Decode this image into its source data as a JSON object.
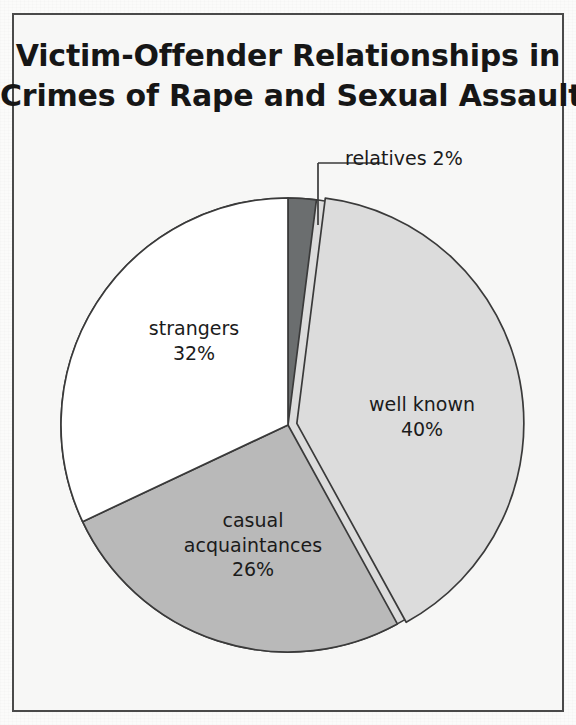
{
  "figure": {
    "title_line_1": "Victim-Offender Relationships in",
    "title_line_2": "Crimes of Rape and Sexual Assault",
    "frame_color": "#4a4a4a",
    "paper_color": "#f7f7f6"
  },
  "labels": {
    "relatives": {
      "name": "relatives 2%",
      "text": "relatives 2%"
    },
    "strangers": {
      "name": "strangers",
      "value": "32%"
    },
    "well_known": {
      "name": "well known",
      "value": "40%"
    },
    "casual": {
      "name_line_1": "casual",
      "name_line_2": "acquaintances",
      "value": "26%"
    }
  },
  "chart_data": {
    "type": "pie",
    "title": "Victim-Offender Relationships in Crimes of Rape and Sexual Assault",
    "xlabel": "",
    "ylabel": "",
    "units": "percent",
    "total": 100,
    "start_angle_deg": 0,
    "direction": "clockwise",
    "legend": "none",
    "grid": false,
    "labels_inside_slices": true,
    "categories": [
      "relatives",
      "well known",
      "casual acquaintances",
      "strangers"
    ],
    "values": [
      2,
      40,
      26,
      32
    ],
    "slices": [
      {
        "label": "relatives",
        "value": 2,
        "display": "relatives 2%",
        "color": "#6b6e6f",
        "exploded": false,
        "label_placement": "outside-leader"
      },
      {
        "label": "well known",
        "value": 40,
        "display": "well known 40%",
        "color": "#dcdcdc",
        "exploded": true,
        "label_placement": "inside"
      },
      {
        "label": "casual acquaintances",
        "value": 26,
        "display": "casual acquaintances 26%",
        "color": "#b9b9b9",
        "exploded": false,
        "label_placement": "inside"
      },
      {
        "label": "strangers",
        "value": 32,
        "display": "strangers 32%",
        "color": "#ffffff",
        "exploded": false,
        "label_placement": "inside"
      }
    ],
    "colors": [
      "#6b6e6f",
      "#dcdcdc",
      "#b9b9b9",
      "#ffffff"
    ],
    "outline_color": "#3a3a3a"
  }
}
